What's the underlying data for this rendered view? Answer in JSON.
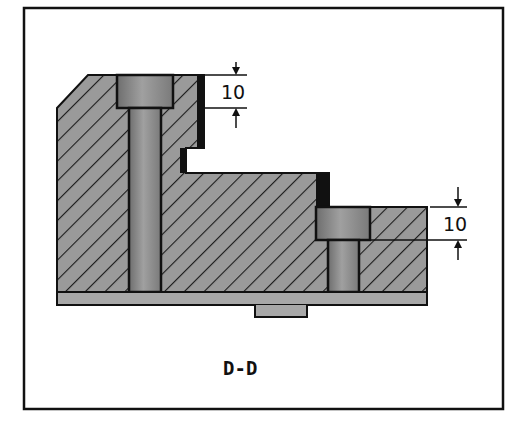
{
  "diagram": {
    "type": "mechanical-section-view",
    "caption": "D-D",
    "dimensions": [
      {
        "id": "upper-counterbore-depth",
        "value": "10"
      },
      {
        "id": "lower-counterbore-depth",
        "value": "10"
      }
    ],
    "colors": {
      "frame": "#111111",
      "hatch_fill": "#9a9a9a",
      "hatch_line": "#1a1a1a",
      "screw_fill": "#8c8c8c",
      "base_plate": "#a8a8a8",
      "background": "#ffffff"
    }
  }
}
